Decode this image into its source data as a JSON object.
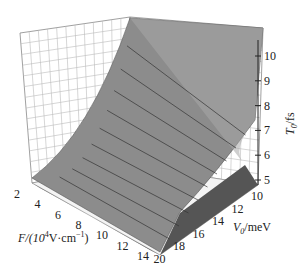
{
  "chart_data": {
    "type": "surface3d",
    "title": "",
    "xlabel": "F/(10^4V·cm^-1)",
    "ylabel": "V0/meV",
    "zlabel": "T0/fs",
    "x_ticks": [
      "2",
      "4",
      "6",
      "8",
      "10",
      "12",
      "14"
    ],
    "y_ticks": [
      "10",
      "12",
      "14",
      "16",
      "18",
      "20"
    ],
    "z_ticks": [
      "5",
      "6",
      "7",
      "8",
      "9",
      "10"
    ],
    "x_range": [
      1,
      15
    ],
    "y_range": [
      10,
      20
    ],
    "z_range": [
      5,
      11
    ],
    "grid": true,
    "legend": "none",
    "surface_corners": [
      {
        "F": 1,
        "V0": 10,
        "T0": 11
      },
      {
        "F": 15,
        "V0": 10,
        "T0": 5
      },
      {
        "F": 1,
        "V0": 20,
        "T0": 5
      },
      {
        "F": 15,
        "V0": 20,
        "T0": 5
      }
    ]
  },
  "labels": {
    "x": "F/(10",
    "x_sup": "4",
    "x_mid": "V·cm",
    "x_sup2": "−1",
    "x_end": ")",
    "y_main": "V",
    "y_sub": "0",
    "y_end": "/meV",
    "z_main": "T",
    "z_sub": "0",
    "z_end": "/fs"
  }
}
